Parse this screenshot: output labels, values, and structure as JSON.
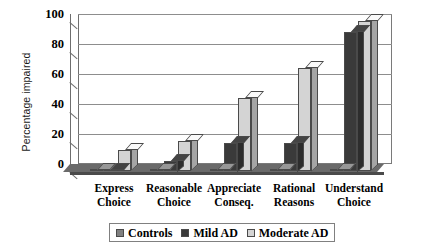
{
  "chart_data": {
    "type": "bar",
    "title": "",
    "xlabel": "",
    "ylabel": "Percentage impaired",
    "ylim": [
      0,
      100
    ],
    "yticks": [
      100,
      80,
      60,
      40,
      20,
      0
    ],
    "grid": true,
    "legend_position": "bottom",
    "style": "3d-clustered-column",
    "categories": [
      "Express Choice",
      "Reasonable Choice",
      "Appreciate Conseq.",
      "Rational Reasons",
      "Understand Choice"
    ],
    "category_lines": [
      [
        "Express",
        "Choice"
      ],
      [
        "Reasonable",
        "Choice"
      ],
      [
        "Appreciate",
        "Conseq."
      ],
      [
        "Rational",
        "Reasons"
      ],
      [
        "Understand",
        "Choice"
      ]
    ],
    "series": [
      {
        "name": "Controls",
        "color": "#808080",
        "values": [
          0,
          0,
          0,
          0,
          0
        ]
      },
      {
        "name": "Mild AD",
        "color": "#3a3a3a",
        "values": [
          0,
          7,
          19,
          19,
          93
        ]
      },
      {
        "name": "Moderate AD",
        "color": "#d4d4d4",
        "values": [
          14,
          20,
          49,
          69,
          100
        ]
      }
    ]
  },
  "legend": {
    "items": [
      {
        "label": "Controls",
        "swatch": "#808080"
      },
      {
        "label": "Mild AD",
        "swatch": "#3a3a3a"
      },
      {
        "label": "Moderate AD",
        "swatch": "#d4d4d4"
      }
    ]
  },
  "axis": {
    "y_title": "Percentage impaired",
    "y_tick_labels": [
      "100",
      "80",
      "60",
      "40",
      "20",
      "0"
    ]
  }
}
